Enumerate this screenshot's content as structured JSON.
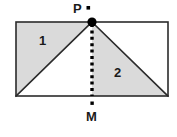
{
  "figure": {
    "background_color": "#ffffff",
    "stroke_color": "#2b2b2b",
    "shade_color": "#dadada",
    "dot_color": "#000000",
    "rectangle": {
      "x": 16,
      "y": 22,
      "width": 152,
      "height": 74
    },
    "points": [
      {
        "id": "P",
        "label": "P",
        "x": 92,
        "y": 22,
        "marker": "filled-circle",
        "label_position": "above-left",
        "has_square_tick": true
      },
      {
        "id": "M",
        "label": "M",
        "x": 92,
        "y": 96,
        "marker": "square-tick",
        "label_position": "below",
        "has_square_tick": true
      }
    ],
    "regions": [
      {
        "id": "region-1",
        "label": "1",
        "shaded": true,
        "fill": "#dadada",
        "description": "upper-left triangle: bottom-left corner, top-left corner, P"
      },
      {
        "id": "region-2",
        "label": "2",
        "shaded": true,
        "fill": "#dadada",
        "description": "lower-right triangle: P, M, bottom-right corner"
      }
    ],
    "segments": [
      {
        "id": "diagonal-left",
        "from": "bottom-left",
        "to": "P",
        "style": "solid"
      },
      {
        "id": "diagonal-right",
        "from": "P",
        "to": "bottom-right",
        "style": "solid"
      },
      {
        "id": "median-PM",
        "from": "P",
        "to": "M",
        "style": "dotted"
      }
    ]
  }
}
